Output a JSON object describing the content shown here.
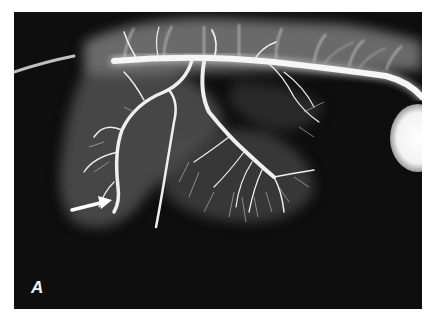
{
  "figure": {
    "type": "angiogram",
    "panel_label": "A",
    "background_color": "#0e0e0e",
    "vessel_color": "#f2f2f2",
    "annotations": [
      {
        "type": "arrow",
        "direction": "pointing-right-upward",
        "position": "lower-left",
        "color": "#ffffff"
      }
    ]
  }
}
